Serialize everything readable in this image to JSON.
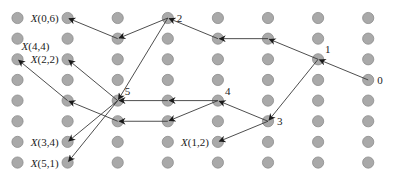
{
  "diagram": {
    "type": "grid-graph",
    "grid": {
      "columns": 8,
      "rows": 8
    },
    "colors": {
      "node_fill": "#a9a9a9",
      "node_stroke": "#8c8c8c",
      "edge": "#3a3a3a",
      "text": "#222222"
    },
    "labeled_nodes": [
      {
        "id": "n0",
        "col": 7,
        "row": 3,
        "label": "0",
        "side": "right"
      },
      {
        "id": "n1",
        "col": 6,
        "row": 2,
        "label": "1",
        "side": "above-right"
      },
      {
        "id": "n2",
        "col": 3,
        "row": 0,
        "label": "2",
        "side": "right"
      },
      {
        "id": "n3",
        "col": 5,
        "row": 5,
        "label": "3",
        "side": "right"
      },
      {
        "id": "n4",
        "col": 4,
        "row": 4,
        "label": "4",
        "side": "above-right"
      },
      {
        "id": "n5",
        "col": 2,
        "row": 4,
        "label": "5",
        "side": "above-right"
      },
      {
        "id": "x06",
        "col": 1,
        "row": 0,
        "label_var": "X",
        "label_args": "(0,6)",
        "side": "left"
      },
      {
        "id": "x44",
        "col": 0,
        "row": 2,
        "label_var": "X",
        "label_args": "(4,4)",
        "side": "above"
      },
      {
        "id": "x22",
        "col": 1,
        "row": 2,
        "label_var": "X",
        "label_args": "(2,2)",
        "side": "left"
      },
      {
        "id": "x34",
        "col": 1,
        "row": 6,
        "label_var": "X",
        "label_args": "(3,4)",
        "side": "left"
      },
      {
        "id": "x51",
        "col": 1,
        "row": 7,
        "label_var": "X",
        "label_args": "(5,1)",
        "side": "left"
      },
      {
        "id": "x12",
        "col": 4,
        "row": 6,
        "label_var": "X",
        "label_args": "(1,2)",
        "side": "left"
      }
    ],
    "edges": [
      {
        "from": [
          7,
          3
        ],
        "to": [
          6,
          2
        ]
      },
      {
        "from": [
          6,
          2
        ],
        "to": [
          5,
          1
        ]
      },
      {
        "from": [
          5,
          1
        ],
        "to": [
          4,
          1
        ]
      },
      {
        "from": [
          4,
          1
        ],
        "to": [
          3,
          0
        ]
      },
      {
        "from": [
          3,
          0
        ],
        "to": [
          2,
          1
        ]
      },
      {
        "from": [
          2,
          1
        ],
        "to": [
          1,
          0
        ]
      },
      {
        "from": [
          3,
          0
        ],
        "to": [
          2,
          4
        ]
      },
      {
        "from": [
          6,
          2
        ],
        "to": [
          5,
          5
        ]
      },
      {
        "from": [
          5,
          5
        ],
        "to": [
          4,
          4
        ]
      },
      {
        "from": [
          5,
          5
        ],
        "to": [
          4,
          6
        ]
      },
      {
        "from": [
          4,
          4
        ],
        "to": [
          3,
          4
        ]
      },
      {
        "from": [
          3,
          4
        ],
        "to": [
          2,
          4
        ]
      },
      {
        "from": [
          4,
          4
        ],
        "to": [
          3,
          5
        ]
      },
      {
        "from": [
          3,
          5
        ],
        "to": [
          2,
          5
        ]
      },
      {
        "from": [
          2,
          5
        ],
        "to": [
          1,
          4
        ]
      },
      {
        "from": [
          1,
          4
        ],
        "to": [
          0,
          2
        ]
      },
      {
        "from": [
          2,
          4
        ],
        "to": [
          1,
          2
        ]
      },
      {
        "from": [
          2,
          4
        ],
        "to": [
          1,
          6
        ]
      },
      {
        "from": [
          2,
          4
        ],
        "to": [
          1,
          7
        ]
      }
    ]
  }
}
